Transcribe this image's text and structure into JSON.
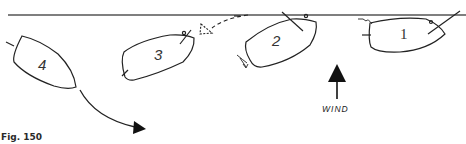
{
  "figure": {
    "caption": "Fig. 150",
    "wind_label": "WIND",
    "colors": {
      "ink": "#222222",
      "line": "#555555",
      "background": "#ffffff"
    }
  },
  "boats": [
    {
      "id": "boat-1",
      "number": "1"
    },
    {
      "id": "boat-2",
      "number": "2"
    },
    {
      "id": "boat-3",
      "number": "3"
    },
    {
      "id": "boat-4",
      "number": "4"
    }
  ],
  "icons": {
    "wind_arrow": "wind-arrow-icon",
    "course_arrow": "course-arrow-icon",
    "turn_arrow": "dashed-turn-arrow-icon"
  }
}
